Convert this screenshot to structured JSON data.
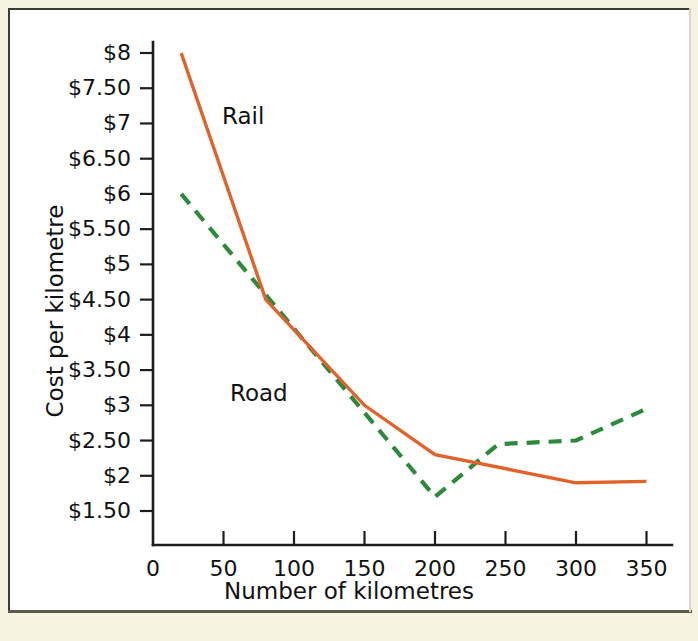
{
  "figure": {
    "frame_color": "#3d3d36",
    "page_background": "#f6f4e0",
    "plot_background": "#ffffff"
  },
  "chart_data": {
    "type": "line",
    "title": "",
    "subtitle": "",
    "xlabel": "Number of kilometres",
    "ylabel": "Cost per kilometre",
    "xlim": [
      0,
      360
    ],
    "ylim": [
      1.25,
      8.25
    ],
    "grid": false,
    "legend": "inline-annotations",
    "x_ticks": [
      0,
      50,
      100,
      150,
      200,
      250,
      300,
      350
    ],
    "x_tick_labels": [
      "0",
      "50",
      "100",
      "150",
      "200",
      "250",
      "300",
      "350"
    ],
    "y_ticks": [
      1.5,
      2,
      2.5,
      3,
      3.5,
      4,
      4.5,
      5,
      5.5,
      6,
      6.5,
      7,
      7.5,
      8
    ],
    "y_tick_labels": [
      "$1.50",
      "$2",
      "$2.50",
      "$3",
      "$3.50",
      "$4",
      "$4.50",
      "$5",
      "$5.50",
      "$6",
      "$6.50",
      "$7",
      "$7.50",
      "$8"
    ],
    "series": [
      {
        "name": "Rail",
        "color": "#e1632a",
        "style": "solid",
        "label_position": "upper-left",
        "x": [
          20,
          80,
          150,
          200,
          300,
          350
        ],
        "values": [
          8.0,
          4.5,
          3.0,
          2.3,
          1.9,
          1.92
        ]
      },
      {
        "name": "Road",
        "color": "#2c8a3c",
        "style": "dashed",
        "label_position": "mid-left",
        "x": [
          20,
          200,
          245,
          300,
          350
        ],
        "values": [
          6.0,
          1.7,
          2.45,
          2.5,
          2.95
        ]
      }
    ],
    "annotations": [
      {
        "text": "Rail",
        "x": 70,
        "y": 6.9
      },
      {
        "text": "Road",
        "x": 75,
        "y": 3.15
      }
    ]
  }
}
